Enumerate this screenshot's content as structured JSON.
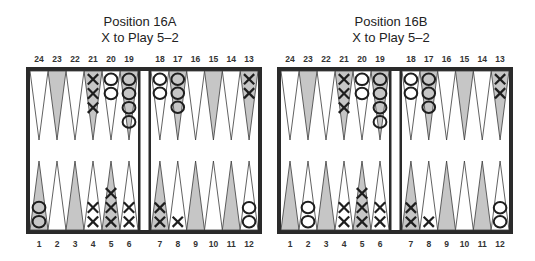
{
  "colors": {
    "frame": "#2a2a2a",
    "board_bg": "#ffffff",
    "dark_point": "#c6c6c6",
    "light_point": "#ffffff",
    "checker_stroke": "#1e1e1e"
  },
  "diagrams": [
    {
      "id": "16A",
      "title_line1": "Position 16A",
      "title_line2": "X to Play 5–2",
      "top_labels": [
        "24",
        "23",
        "22",
        "21",
        "20",
        "19",
        "18",
        "17",
        "16",
        "15",
        "14",
        "13"
      ],
      "bottom_labels": [
        "1",
        "2",
        "3",
        "4",
        "5",
        "6",
        "7",
        "8",
        "9",
        "10",
        "11",
        "12"
      ],
      "points": {
        "1": {
          "player": "O",
          "count": 2
        },
        "4": {
          "player": "X",
          "count": 2
        },
        "5": {
          "player": "X",
          "count": 3
        },
        "6": {
          "player": "X",
          "count": 2
        },
        "7": {
          "player": "X",
          "count": 2
        },
        "8": {
          "player": "X",
          "count": 1
        },
        "12": {
          "player": "O",
          "count": 2
        },
        "13": {
          "player": "X",
          "count": 2
        },
        "17": {
          "player": "O",
          "count": 3
        },
        "18": {
          "player": "O",
          "count": 2
        },
        "19": {
          "player": "O",
          "count": 4
        },
        "20": {
          "player": "O",
          "count": 2
        },
        "21": {
          "player": "X",
          "count": 3
        }
      }
    },
    {
      "id": "16B",
      "title_line1": "Position 16B",
      "title_line2": "X to Play 5–2",
      "top_labels": [
        "24",
        "23",
        "22",
        "21",
        "20",
        "19",
        "18",
        "17",
        "16",
        "15",
        "14",
        "13"
      ],
      "bottom_labels": [
        "1",
        "2",
        "3",
        "4",
        "5",
        "6",
        "7",
        "8",
        "9",
        "10",
        "11",
        "12"
      ],
      "points": {
        "2": {
          "player": "O",
          "count": 2
        },
        "4": {
          "player": "X",
          "count": 2
        },
        "5": {
          "player": "X",
          "count": 3
        },
        "6": {
          "player": "X",
          "count": 2
        },
        "7": {
          "player": "X",
          "count": 2
        },
        "8": {
          "player": "X",
          "count": 1
        },
        "12": {
          "player": "O",
          "count": 2
        },
        "13": {
          "player": "X",
          "count": 2
        },
        "17": {
          "player": "O",
          "count": 3
        },
        "18": {
          "player": "O",
          "count": 2
        },
        "19": {
          "player": "O",
          "count": 4
        },
        "20": {
          "player": "O",
          "count": 2
        },
        "21": {
          "player": "X",
          "count": 3
        }
      }
    }
  ]
}
